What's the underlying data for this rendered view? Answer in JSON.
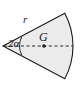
{
  "figure": {
    "kind": "circular-sector-centroid-diagram",
    "background_color": "#ffffff",
    "fill_color": "#ebebeb",
    "stroke_color": "#1a1a1a",
    "labels": {
      "radius": "r",
      "apex_angle": "2α",
      "centroid": "G"
    },
    "geometry": {
      "apex_x": 3,
      "apex_y": 46,
      "radius_px": 70,
      "half_angle_deg": 28,
      "arc_right_x": 73,
      "top_vertex_x": 57,
      "top_vertex_y": 8,
      "bottom_vertex_x": 57,
      "bottom_vertex_y": 81,
      "centroid_dot_x": 44,
      "centroid_dot_y": 46
    },
    "elements": {
      "axis_style": "dashed",
      "angle_marker": "arc",
      "centroid_marker": "filled-dot"
    }
  }
}
